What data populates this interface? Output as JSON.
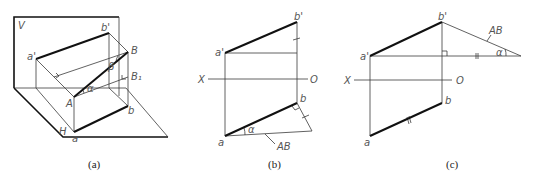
{
  "figure_a": {
    "caption": "(a)",
    "labels": {
      "V": "V",
      "H": "H",
      "a_prime": "a'",
      "b_prime": "b'",
      "A": "A",
      "B": "B",
      "B1": "B₁",
      "a": "a",
      "b": "b",
      "alpha": "α",
      "beta": "β"
    }
  },
  "figure_b": {
    "caption": "(b)",
    "labels": {
      "a_prime": "a'",
      "b_prime": "b'",
      "X": "X",
      "O": "O",
      "a": "a",
      "b": "b",
      "alpha": "α",
      "AB": "AB"
    }
  },
  "figure_c": {
    "caption": "(c)",
    "labels": {
      "a_prime": "a'",
      "b_prime": "b'",
      "X": "X",
      "O": "O",
      "a": "a",
      "b": "b",
      "alpha": "α",
      "AB": "AB"
    }
  }
}
